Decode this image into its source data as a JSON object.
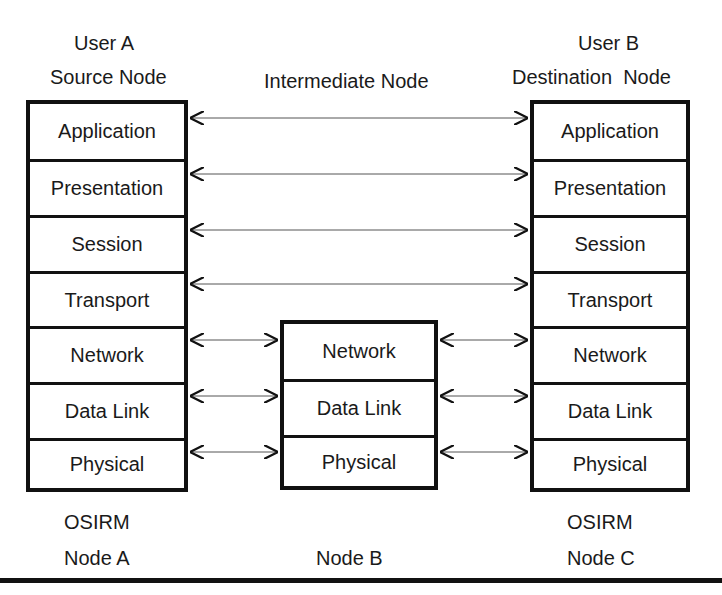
{
  "nodes": {
    "a": {
      "user": "User A",
      "role": "Source Node",
      "model": "OSIRM",
      "name": "Node A",
      "layers": [
        "Application",
        "Presentation",
        "Session",
        "Transport",
        "Network",
        "Data Link",
        "Physical"
      ]
    },
    "b": {
      "role": "Intermediate Node",
      "name": "Node B",
      "layers": [
        "Network",
        "Data Link",
        "Physical"
      ]
    },
    "c": {
      "user": "User B",
      "role": "Destination  Node",
      "model": "OSIRM",
      "name": "Node C",
      "layers": [
        "Application",
        "Presentation",
        "Session",
        "Transport",
        "Network",
        "Data Link",
        "Physical"
      ]
    }
  },
  "colors": {
    "line": "#111111",
    "arrow": "#555555",
    "background": "#ffffff"
  }
}
